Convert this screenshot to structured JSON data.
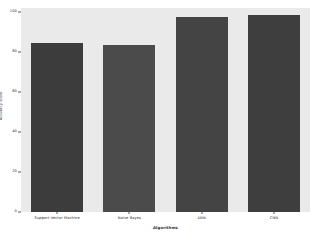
{
  "chart_data": {
    "type": "bar",
    "title": "",
    "subtitle": "",
    "xlabel": "Algorithms",
    "ylabel": "Accuracy score",
    "categories": [
      "Support Vector Machine",
      "Naive Bayes",
      "ANN",
      "CNN"
    ],
    "values": [
      84.5,
      83.5,
      97.5,
      98.5
    ],
    "series": [
      {
        "name": "Accuracy score",
        "values": [
          84.5,
          83.5,
          97.5,
          98.5
        ]
      }
    ],
    "ylim": [
      0,
      102
    ],
    "yticks": [
      0,
      20,
      40,
      60,
      80,
      100
    ],
    "ytick_labels": [
      "0",
      "20",
      "40",
      "60",
      "80",
      "100"
    ],
    "grid": false,
    "legend": null,
    "legend_position": "none",
    "bar_colors": [
      "#3c3c3c",
      "#4b4b4b",
      "#444444",
      "#3e3e3e"
    ],
    "plot_background": "#eaeaea",
    "figure_background": "#ffffff",
    "annotations": []
  }
}
